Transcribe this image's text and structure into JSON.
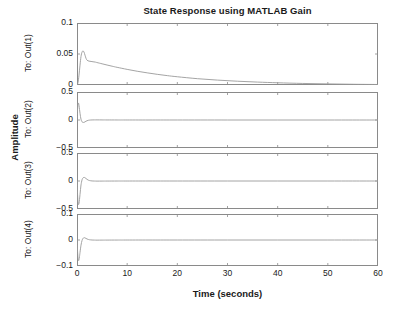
{
  "figure": {
    "title": "State Response using MATLAB Gain",
    "xlabel": "Time (seconds)",
    "ylabel": "Amplitude",
    "background": "#ffffff",
    "axis_color": "#8a8a8a",
    "trace_color": "#9a9a9a",
    "text_color": "#1a1a1a"
  },
  "xaxis": {
    "min": 0,
    "max": 60,
    "ticks": [
      0,
      10,
      20,
      30,
      40,
      50,
      60
    ],
    "tick_labels": [
      "0",
      "10",
      "20",
      "30",
      "40",
      "50",
      "60"
    ]
  },
  "chart_data": {
    "type": "line",
    "title": "State Response using MATLAB Gain",
    "xlabel": "Time (seconds)",
    "ylabel": "Amplitude",
    "xlim": [
      0,
      60
    ],
    "grid": false,
    "legend": null,
    "x_ticks": [
      0,
      10,
      20,
      30,
      40,
      50,
      60
    ],
    "subplots": [
      {
        "name": "To: Out(1)",
        "row_label": "To: Out(1)",
        "ylim": [
          0,
          0.1
        ],
        "y_ticks": [
          0,
          0.05,
          0.1
        ],
        "y_tick_labels": [
          "0",
          "0.05",
          "0.1"
        ],
        "series": [
          {
            "name": "Out(1)",
            "x": [
              0,
              0.2,
              0.4,
              0.6,
              0.8,
              1.0,
              1.2,
              1.4,
              1.6,
              1.8,
              2.0,
              2.4,
              2.8,
              3.2,
              3.6,
              4.0,
              5.0,
              6.0,
              7.0,
              8.0,
              10.0,
              12.0,
              14.0,
              16.0,
              18.0,
              20.0,
              24.0,
              28.0,
              32.0,
              36.0,
              40.0,
              45.0,
              50.0,
              55.0,
              60.0
            ],
            "y": [
              0.0,
              0.004,
              0.016,
              0.032,
              0.046,
              0.053,
              0.055,
              0.053,
              0.048,
              0.043,
              0.04,
              0.0385,
              0.038,
              0.0375,
              0.037,
              0.0362,
              0.0342,
              0.0322,
              0.0303,
              0.0285,
              0.0252,
              0.0222,
              0.0196,
              0.0172,
              0.0151,
              0.0133,
              0.0102,
              0.0079,
              0.0061,
              0.0047,
              0.0036,
              0.0025,
              0.0018,
              0.0012,
              0.0008
            ]
          }
        ]
      },
      {
        "name": "To: Out(2)",
        "row_label": "To: Out(2)",
        "ylim": [
          -0.5,
          0.5
        ],
        "y_ticks": [
          -0.5,
          0,
          0.5
        ],
        "y_tick_labels": [
          "-0.5",
          "0",
          "0.5"
        ],
        "series": [
          {
            "name": "Out(2)",
            "x": [
              0,
              0.1,
              0.2,
              0.3,
              0.4,
              0.5,
              0.6,
              0.7,
              0.8,
              0.9,
              1.0,
              1.2,
              1.4,
              1.6,
              1.8,
              2.0,
              2.2,
              2.5,
              3.0,
              3.5,
              4.0,
              5.0,
              6.0,
              8.0,
              10.0,
              15.0,
              20.0,
              30.0,
              40.0,
              50.0,
              60.0
            ],
            "y": [
              0.0,
              0.18,
              0.29,
              0.3,
              0.26,
              0.19,
              0.12,
              0.06,
              0.015,
              -0.015,
              -0.032,
              -0.044,
              -0.042,
              -0.033,
              -0.022,
              -0.013,
              -0.007,
              -0.002,
              0.001,
              0.002,
              0.002,
              0.0015,
              0.001,
              0.0006,
              0.0004,
              0.0002,
              0.0001,
              0.0,
              0.0,
              0.0,
              0.0
            ]
          }
        ]
      },
      {
        "name": "To: Out(3)",
        "row_label": "To: Out(3)",
        "ylim": [
          -0.5,
          0.5
        ],
        "y_ticks": [
          -0.5,
          0,
          0.5
        ],
        "y_tick_labels": [
          "-0.5",
          "0",
          "0.5"
        ],
        "series": [
          {
            "name": "Out(3)",
            "x": [
              0,
              0.1,
              0.2,
              0.3,
              0.4,
              0.5,
              0.6,
              0.7,
              0.8,
              1.0,
              1.2,
              1.4,
              1.6,
              1.8,
              2.0,
              2.2,
              2.5,
              3.0,
              3.5,
              4.0,
              5.0,
              6.0,
              8.0,
              10.0,
              15.0,
              20.0,
              30.0,
              40.0,
              50.0,
              60.0
            ],
            "y": [
              0.0,
              -0.22,
              -0.37,
              -0.42,
              -0.4,
              -0.33,
              -0.24,
              -0.15,
              -0.07,
              0.02,
              0.055,
              0.065,
              0.058,
              0.044,
              0.03,
              0.018,
              0.008,
              0.001,
              -0.001,
              -0.002,
              -0.0015,
              -0.001,
              -0.0005,
              -0.0003,
              -0.0001,
              0.0,
              0.0,
              0.0,
              0.0,
              0.0
            ]
          }
        ]
      },
      {
        "name": "To: Out(4)",
        "row_label": "To: Out(4)",
        "ylim": [
          -0.1,
          0.1
        ],
        "y_ticks": [
          -0.1,
          0,
          0.1
        ],
        "y_tick_labels": [
          "-0.1",
          "0",
          "0.1"
        ],
        "series": [
          {
            "name": "Out(4)",
            "x": [
              0,
              0.1,
              0.2,
              0.3,
              0.4,
              0.5,
              0.6,
              0.8,
              1.0,
              1.2,
              1.4,
              1.6,
              1.8,
              2.0,
              2.2,
              2.5,
              3.0,
              3.5,
              4.0,
              5.0,
              6.0,
              8.0,
              10.0,
              15.0,
              20.0,
              30.0,
              40.0,
              50.0,
              60.0
            ],
            "y": [
              0.0,
              -0.04,
              -0.068,
              -0.079,
              -0.076,
              -0.064,
              -0.048,
              -0.02,
              -0.002,
              0.006,
              0.009,
              0.008,
              0.006,
              0.004,
              0.0025,
              0.001,
              0.0,
              -0.0004,
              -0.0005,
              -0.0004,
              -0.0003,
              -0.0002,
              -0.0001,
              0.0,
              0.0,
              0.0,
              0.0,
              0.0,
              0.0
            ]
          }
        ]
      }
    ]
  }
}
